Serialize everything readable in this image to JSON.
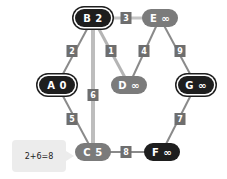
{
  "graph": {
    "nodes": [
      {
        "id": "B",
        "label": "B 2",
        "x": 93,
        "y": 18,
        "style": "ring"
      },
      {
        "id": "E",
        "label": "E ∞",
        "x": 160,
        "y": 18,
        "style": "gray"
      },
      {
        "id": "A",
        "label": "A 0",
        "x": 57,
        "y": 85,
        "style": "ring"
      },
      {
        "id": "D",
        "label": "D ∞",
        "x": 129,
        "y": 85,
        "style": "gray"
      },
      {
        "id": "G",
        "label": "G ∞",
        "x": 196,
        "y": 85,
        "style": "ring"
      },
      {
        "id": "C",
        "label": "C 5",
        "x": 93,
        "y": 152,
        "style": "gray"
      },
      {
        "id": "F",
        "label": "F ∞",
        "x": 162,
        "y": 152,
        "style": "black"
      }
    ],
    "edges": [
      {
        "from": "B",
        "to": "E",
        "weight": "3",
        "lx": 126,
        "ly": 18,
        "color": "#c4c4c4",
        "width": 3
      },
      {
        "from": "A",
        "to": "B",
        "weight": "2",
        "lx": 72,
        "ly": 51,
        "color": "#8a8a8a",
        "width": 2
      },
      {
        "from": "B",
        "to": "D",
        "weight": "1",
        "lx": 111,
        "ly": 51,
        "color": "#b4b4b4",
        "width": 3
      },
      {
        "from": "B",
        "to": "C",
        "weight": "6",
        "lx": 93,
        "ly": 95,
        "color": "#bdbdbd",
        "width": 4
      },
      {
        "from": "E",
        "to": "D",
        "weight": "4",
        "lx": 144,
        "ly": 51,
        "color": "#8a8a8a",
        "width": 2
      },
      {
        "from": "E",
        "to": "G",
        "weight": "9",
        "lx": 180,
        "ly": 51,
        "color": "#8a8a8a",
        "width": 2
      },
      {
        "from": "A",
        "to": "C",
        "weight": "5",
        "lx": 72,
        "ly": 119,
        "color": "#8a8a8a",
        "width": 2
      },
      {
        "from": "C",
        "to": "F",
        "weight": "8",
        "lx": 126,
        "ly": 152,
        "color": "#8a8a8a",
        "width": 2
      },
      {
        "from": "G",
        "to": "F",
        "weight": "7",
        "lx": 180,
        "ly": 119,
        "color": "#8a8a8a",
        "width": 2
      }
    ]
  },
  "tooltip": {
    "text": "2+6=8",
    "target": "C"
  },
  "colors": {
    "node_gray": "#7b7b7b",
    "node_dark": "#1e1e1e",
    "weight_label": "#6e6e6e",
    "tooltip_bg": "#ececec"
  }
}
